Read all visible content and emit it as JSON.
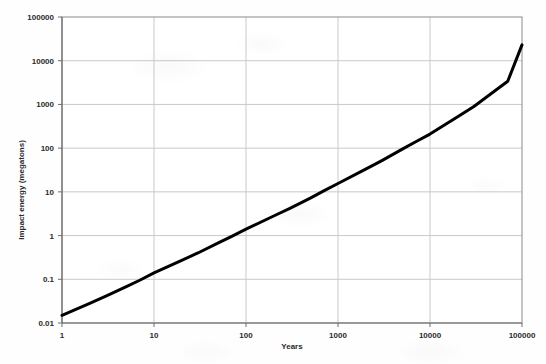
{
  "chart_data": {
    "type": "line",
    "title": "",
    "xlabel": "Years",
    "ylabel": "Impact energy (megatons)",
    "xscale": "log",
    "yscale": "log",
    "xlim": [
      1,
      100000
    ],
    "ylim": [
      0.01,
      100000
    ],
    "grid": true,
    "legend_position": "none",
    "x_tick_labels": [
      "1",
      "10",
      "100",
      "1000",
      "10000",
      "100000"
    ],
    "x_tick_values": [
      1,
      10,
      100,
      1000,
      10000,
      100000
    ],
    "y_tick_labels": [
      "0.01",
      "0.1",
      "1",
      "10",
      "100",
      "1000",
      "10000",
      "100000"
    ],
    "y_tick_values": [
      0.01,
      0.1,
      1,
      10,
      100,
      1000,
      10000,
      100000
    ],
    "series": [
      {
        "name": "Impact energy vs. recurrence interval",
        "color": "#000000",
        "line_width_px": 3,
        "x": [
          1,
          2,
          3,
          5,
          7,
          10,
          20,
          30,
          50,
          70,
          100,
          200,
          300,
          500,
          700,
          1000,
          2000,
          3000,
          5000,
          7000,
          10000,
          20000,
          30000,
          50000,
          70000,
          100000
        ],
        "y": [
          0.015,
          0.028,
          0.041,
          0.068,
          0.095,
          0.14,
          0.27,
          0.4,
          0.68,
          0.96,
          1.4,
          2.8,
          4.2,
          7.2,
          10.5,
          15.5,
          33,
          52,
          95,
          140,
          210,
          520,
          900,
          2000,
          3400,
          23000
        ]
      }
    ],
    "annotations": []
  },
  "axes": {
    "x_axis_name": "years-axis",
    "y_axis_name": "impact-energy-axis"
  }
}
